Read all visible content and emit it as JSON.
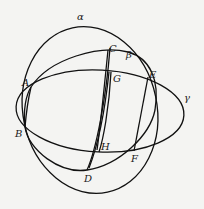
{
  "diagram": {
    "curve_labels": {
      "alpha": "α",
      "beta": "β",
      "gamma": "γ"
    },
    "points": {
      "A": "A",
      "B": "B",
      "C": "C",
      "D": "D",
      "E": "E",
      "F": "F",
      "G": "G",
      "H": "H"
    },
    "colors": {
      "stroke": "#111111",
      "background": "#f4f4f2"
    }
  }
}
